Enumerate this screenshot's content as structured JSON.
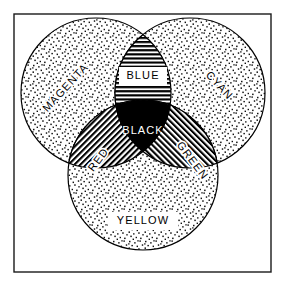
{
  "figure": {
    "background_color": "#ffffff",
    "ink_color": "#000000",
    "border": {
      "name": "frame",
      "x": 14,
      "y": 14,
      "width": 257,
      "height": 258,
      "stroke": "#1a1a1a",
      "stroke_width": 1.4
    }
  },
  "circles": [
    {
      "id": "magenta",
      "label": "MAGENTA",
      "fill_pattern": "stipple",
      "cx": 96,
      "cy": 93,
      "r": 75,
      "label_x": 66,
      "label_y": 88,
      "label_rotation": -47,
      "label_style": "outline"
    },
    {
      "id": "cyan",
      "label": "CYAN",
      "fill_pattern": "stipple",
      "cx": 190,
      "cy": 93,
      "r": 75,
      "label_x": 219,
      "label_y": 86,
      "label_rotation": 47,
      "label_style": "outline"
    },
    {
      "id": "yellow",
      "label": "YELLOW",
      "fill_pattern": "stipple",
      "cx": 143,
      "cy": 175,
      "r": 75,
      "label_x": 143,
      "label_y": 221,
      "label_rotation": 0,
      "label_style": "boxed"
    }
  ],
  "overlaps": [
    {
      "id": "blue",
      "label": "BLUE",
      "description": "magenta and cyan overlap",
      "fill_pattern": "horizontal-lines",
      "label_x": 143,
      "label_y": 76,
      "label_rotation": 0,
      "label_style": "boxed"
    },
    {
      "id": "red",
      "label": "RED",
      "description": "magenta and yellow overlap",
      "fill_pattern": "diagonal-lines-backslash",
      "label_x": 99,
      "label_y": 160,
      "label_rotation": -53,
      "label_style": "outline"
    },
    {
      "id": "green",
      "label": "GREEN",
      "description": "cyan and yellow overlap",
      "fill_pattern": "diagonal-lines-slash",
      "label_x": 192,
      "label_y": 161,
      "label_rotation": 53,
      "label_style": "outline"
    },
    {
      "id": "black",
      "label": "BLACK",
      "description": "magenta, cyan and yellow overlap",
      "fill_pattern": "solid-black",
      "label_x": 143,
      "label_y": 131,
      "label_rotation": 0,
      "label_style": "reverse"
    }
  ],
  "typography": {
    "label_font_size": 11,
    "label_letter_spacing": 1.1,
    "label_fill_dark": "#000000",
    "label_fill_light": "#ffffff",
    "label_box_fill": "#ffffff"
  }
}
